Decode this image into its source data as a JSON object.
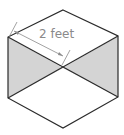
{
  "diagram": {
    "type": "isometric-hexagon-figure",
    "dimension_label": "2 feet",
    "colors": {
      "stroke": "#2b2b2b",
      "shaded_face": "#d4d4d4",
      "background": "#ffffff",
      "dimension_line": "#8a8a8a"
    },
    "vertices": {
      "top": [
        63,
        10
      ],
      "upper_left": [
        8,
        37
      ],
      "upper_right": [
        118,
        36
      ],
      "center": [
        63,
        68
      ],
      "lower_left": [
        8,
        98
      ],
      "lower_right": [
        118,
        97
      ],
      "bottom": [
        63,
        128
      ]
    },
    "shaded_regions": [
      "left-triangle",
      "right-triangle"
    ]
  }
}
